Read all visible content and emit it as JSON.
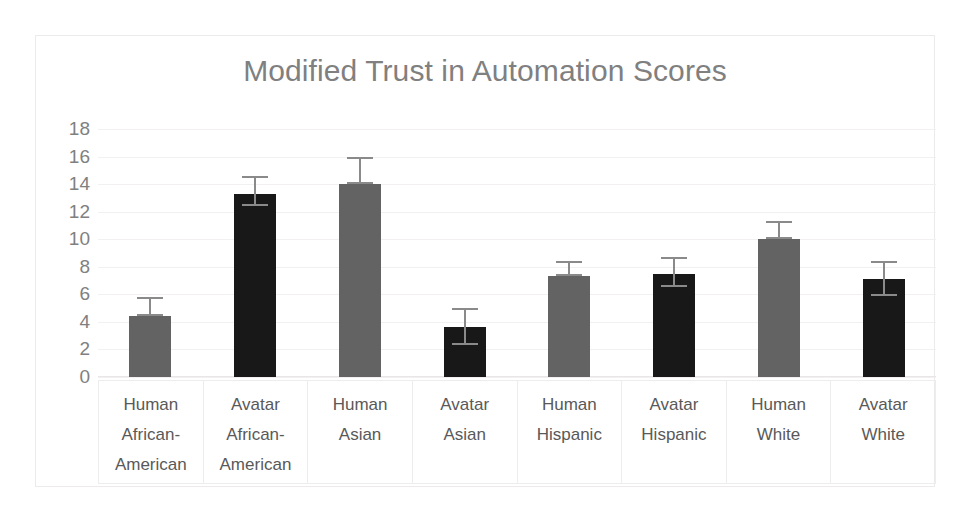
{
  "chart_data": {
    "type": "bar",
    "title": "Modified Trust in Automation Scores",
    "xlabel": "",
    "ylabel": "",
    "ylim": [
      0,
      18
    ],
    "ytick_step": 2,
    "yticks": [
      18,
      16,
      14,
      12,
      10,
      8,
      6,
      4,
      2,
      0
    ],
    "grid": true,
    "legend": "none",
    "categories": [
      "Human African-American",
      "Avatar African-American",
      "Human Asian",
      "Avatar Asian",
      "Human Hispanic",
      "Avatar Hispanic",
      "Human White",
      "Avatar White"
    ],
    "category_lines": [
      [
        "Human",
        "African-",
        "American"
      ],
      [
        "Avatar",
        "African-",
        "American"
      ],
      [
        "Human",
        "Asian",
        ""
      ],
      [
        "Avatar",
        "Asian",
        ""
      ],
      [
        "Human",
        "Hispanic",
        ""
      ],
      [
        "Avatar",
        "Hispanic",
        ""
      ],
      [
        "Human",
        "White",
        ""
      ],
      [
        "Avatar",
        "White",
        ""
      ]
    ],
    "values": [
      4.4,
      13.3,
      14.0,
      3.6,
      7.3,
      7.5,
      10.0,
      7.1
    ],
    "error_upper": [
      5.8,
      14.6,
      16.0,
      5.0,
      8.4,
      8.7,
      11.3,
      8.4
    ],
    "error_lower": [
      4.4,
      12.4,
      14.0,
      2.3,
      7.3,
      6.5,
      10.0,
      5.9
    ],
    "agent_type": [
      "Human",
      "Avatar",
      "Human",
      "Avatar",
      "Human",
      "Avatar",
      "Human",
      "Avatar"
    ],
    "colors": {
      "human_bar": "#636363",
      "avatar_bar": "#181818",
      "error_bar": "#8a8a8a",
      "title_text": "#808080",
      "tick_text": "#808080",
      "category_text": "#595959",
      "gridline": "#f2f0f0",
      "frame_border": "#eceaea",
      "background": "#ffffff"
    }
  }
}
